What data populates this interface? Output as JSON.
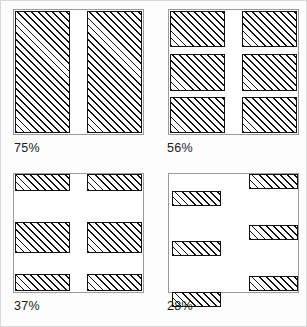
{
  "figure": {
    "width": 307,
    "height": 327,
    "background": "#fdfdfd",
    "border_color": "#d8d8d8",
    "hatch_color": "#111111",
    "hatch_direction": "forward-slash-45deg"
  },
  "chart_data": {
    "type": "bar",
    "title": "",
    "subtitle": "",
    "xlabel": "",
    "ylabel": "",
    "grid": false,
    "legend": null,
    "categories": [
      "75%",
      "56%",
      "37%",
      "28%"
    ],
    "values": [
      75,
      56,
      37,
      28
    ],
    "units": "percent",
    "panels": [
      {
        "id": "panel-75",
        "label": "75%",
        "value": 75,
        "position": "top-left",
        "block_count": 2,
        "layout": "two-tall-columns",
        "blocks": [
          {
            "x": 0.5,
            "y": 0.5,
            "w": 43.0,
            "h": 99.0
          },
          {
            "x": 56.5,
            "y": 0.5,
            "w": 43.0,
            "h": 99.0
          }
        ]
      },
      {
        "id": "panel-56",
        "label": "56%",
        "value": 56,
        "position": "top-right",
        "block_count": 6,
        "layout": "two-by-three-grid",
        "blocks": [
          {
            "x": 0.5,
            "y": 0.5,
            "w": 43.0,
            "h": 29.5
          },
          {
            "x": 56.5,
            "y": 0.5,
            "w": 43.0,
            "h": 29.5
          },
          {
            "x": 0.5,
            "y": 35.5,
            "w": 43.0,
            "h": 29.5
          },
          {
            "x": 56.5,
            "y": 35.5,
            "w": 43.0,
            "h": 29.5
          },
          {
            "x": 0.5,
            "y": 70.0,
            "w": 43.0,
            "h": 29.5
          },
          {
            "x": 56.5,
            "y": 70.0,
            "w": 43.0,
            "h": 29.5
          }
        ]
      },
      {
        "id": "panel-37",
        "label": "37%",
        "value": 37,
        "position": "bottom-left",
        "block_count": 6,
        "layout": "two-by-three-grid-thin-ends",
        "blocks": [
          {
            "x": 0.5,
            "y": 0.5,
            "w": 43.0,
            "h": 14.0
          },
          {
            "x": 56.5,
            "y": 0.5,
            "w": 43.0,
            "h": 14.0
          },
          {
            "x": 0.5,
            "y": 41.0,
            "w": 43.0,
            "h": 26.0
          },
          {
            "x": 56.5,
            "y": 41.0,
            "w": 43.0,
            "h": 26.0
          },
          {
            "x": 0.5,
            "y": 85.5,
            "w": 43.0,
            "h": 14.0
          },
          {
            "x": 56.5,
            "y": 85.5,
            "w": 43.0,
            "h": 14.0
          }
        ]
      },
      {
        "id": "panel-28",
        "label": "28%",
        "value": 28,
        "position": "bottom-right",
        "block_count": 6,
        "layout": "staggered-thin-bars",
        "blocks": [
          {
            "x": 62.0,
            "y": 0.5,
            "w": 38.0,
            "h": 13.0
          },
          {
            "x": 2.0,
            "y": 14.5,
            "w": 38.0,
            "h": 13.0
          },
          {
            "x": 62.0,
            "y": 43.5,
            "w": 38.0,
            "h": 13.0
          },
          {
            "x": 2.0,
            "y": 57.0,
            "w": 38.0,
            "h": 13.0
          },
          {
            "x": 62.0,
            "y": 86.5,
            "w": 38.0,
            "h": 13.0
          },
          {
            "x": 2.0,
            "y": 100.0,
            "w": 38.0,
            "h": 13.0
          }
        ]
      }
    ]
  }
}
